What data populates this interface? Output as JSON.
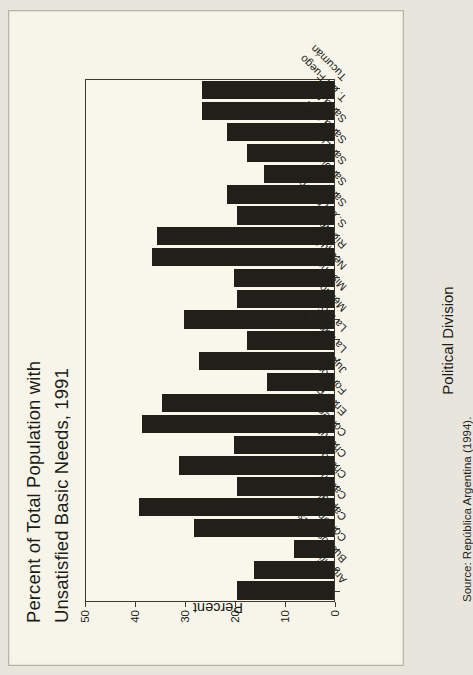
{
  "figure": {
    "title_line1": "Percent of Total Population with",
    "title_line2": "Unsatisfied Basic Needs, 1991",
    "x_axis_title": "Political Division",
    "y_axis_title": "Percent",
    "source": "Source: República Argentina (1994).",
    "bar_color": "#211f19",
    "page_color": "#f7f5e9",
    "axis_color": "#3a382f"
  },
  "chart_data": {
    "type": "bar",
    "title": "Percent of Total Population with Unsatisfied Basic Needs, 1991",
    "xlabel": "Political Division",
    "ylabel": "Percent",
    "ylim": [
      0,
      50
    ],
    "yticks": [
      0,
      10,
      20,
      30,
      40,
      50
    ],
    "grid": false,
    "legend": null,
    "orientation": "vertical-rotated-page",
    "categories": [
      "Argentina",
      "Buenos Aires",
      "Córdoba",
      "Capital City",
      "Catamarca",
      "Chaco",
      "Chubut",
      "Corrientes",
      "Entre Ríos",
      "Formosa",
      "Jujuy",
      "La Pampa",
      "La Rioja",
      "Mendoza",
      "Misiones",
      "Neuquén",
      "Río Negro",
      "S. del Estero",
      "Salta",
      "San Juan",
      "San Luis",
      "Santa Cruz",
      "Santa Fe",
      "T. del Fuego",
      "Tucumán"
    ],
    "values": [
      19.5,
      16.0,
      8.0,
      28.0,
      39.0,
      19.5,
      31.0,
      20.0,
      38.5,
      34.5,
      13.5,
      27.0,
      17.5,
      30.0,
      19.5,
      20.0,
      36.5,
      35.5,
      19.5,
      21.5,
      14.0,
      17.5,
      21.5,
      26.5,
      26.5
    ]
  }
}
